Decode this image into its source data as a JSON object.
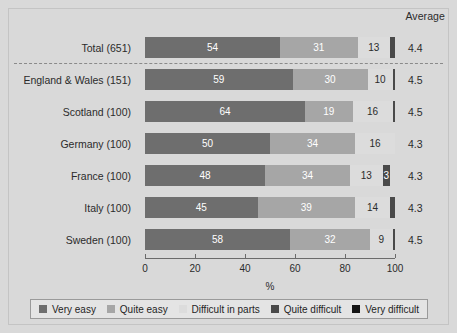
{
  "header": {
    "average_label": "Average"
  },
  "axis": {
    "title": "%",
    "ticks": [
      0,
      20,
      40,
      60,
      80,
      100
    ],
    "min": 0,
    "max": 100
  },
  "legend": {
    "items": [
      {
        "label": "Very easy",
        "color": "#6e6e6e",
        "key": "very_easy"
      },
      {
        "label": "Quite easy",
        "color": "#a6a6a6",
        "key": "quite_easy"
      },
      {
        "label": "Difficult in parts",
        "color": "#dcdcdc",
        "key": "difficult_in_parts"
      },
      {
        "label": "Quite difficult",
        "color": "#4a4a4a",
        "key": "quite_difficult"
      },
      {
        "label": "Very difficult",
        "color": "#141414",
        "key": "very_difficult"
      }
    ]
  },
  "chart_data": {
    "type": "bar",
    "title": "",
    "subtitle": "",
    "orientation": "horizontal",
    "stacked": true,
    "stack_total": 100,
    "xlabel": "%",
    "ylabel": "",
    "xlim": [
      0,
      100
    ],
    "xticks": [
      0,
      20,
      40,
      60,
      80,
      100
    ],
    "grid": false,
    "legend_position": "bottom",
    "categories": [
      "Total (651)",
      "England & Wales (151)",
      "Scotland (100)",
      "Germany (100)",
      "France (100)",
      "Italy (100)",
      "Sweden (100)"
    ],
    "series": [
      {
        "name": "Very easy",
        "color": "#6e6e6e",
        "values": [
          54,
          59,
          64,
          50,
          48,
          45,
          58
        ]
      },
      {
        "name": "Quite easy",
        "color": "#a6a6a6",
        "values": [
          31,
          30,
          19,
          34,
          34,
          39,
          32
        ]
      },
      {
        "name": "Difficult in parts",
        "color": "#dcdcdc",
        "values": [
          13,
          10,
          16,
          16,
          13,
          14,
          9
        ]
      },
      {
        "name": "Quite difficult",
        "color": "#4a4a4a",
        "values": [
          2,
          1,
          1,
          0,
          3,
          2,
          1
        ]
      },
      {
        "name": "Very difficult",
        "color": "#141414",
        "values": [
          0,
          0,
          0,
          0,
          0,
          0,
          0
        ]
      }
    ],
    "annotations": {
      "average_column_label": "Average",
      "averages": [
        4.4,
        4.5,
        4.5,
        4.3,
        4.3,
        4.3,
        4.5
      ],
      "separator_after_row": 0
    }
  },
  "rows": [
    {
      "label": "Total (651)",
      "average": "4.4",
      "segments": [
        {
          "key": "very_easy",
          "value": 54,
          "text": "54"
        },
        {
          "key": "quite_easy",
          "value": 31,
          "text": "31"
        },
        {
          "key": "difficult_in_parts",
          "value": 13,
          "text": "13"
        },
        {
          "key": "quite_difficult",
          "value": 2,
          "text": ""
        }
      ]
    },
    {
      "label": "England & Wales (151)",
      "average": "4.5",
      "segments": [
        {
          "key": "very_easy",
          "value": 59,
          "text": "59"
        },
        {
          "key": "quite_easy",
          "value": 30,
          "text": "30"
        },
        {
          "key": "difficult_in_parts",
          "value": 10,
          "text": "10"
        },
        {
          "key": "quite_difficult",
          "value": 1,
          "text": ""
        }
      ]
    },
    {
      "label": "Scotland (100)",
      "average": "4.5",
      "segments": [
        {
          "key": "very_easy",
          "value": 64,
          "text": "64"
        },
        {
          "key": "quite_easy",
          "value": 19,
          "text": "19"
        },
        {
          "key": "difficult_in_parts",
          "value": 16,
          "text": "16"
        },
        {
          "key": "quite_difficult",
          "value": 1,
          "text": ""
        }
      ]
    },
    {
      "label": "Germany (100)",
      "average": "4.3",
      "segments": [
        {
          "key": "very_easy",
          "value": 50,
          "text": "50"
        },
        {
          "key": "quite_easy",
          "value": 34,
          "text": "34"
        },
        {
          "key": "difficult_in_parts",
          "value": 16,
          "text": "16"
        }
      ]
    },
    {
      "label": "France (100)",
      "average": "4.3",
      "segments": [
        {
          "key": "very_easy",
          "value": 48,
          "text": "48"
        },
        {
          "key": "quite_easy",
          "value": 34,
          "text": "34"
        },
        {
          "key": "difficult_in_parts",
          "value": 13,
          "text": "13"
        },
        {
          "key": "quite_difficult",
          "value": 3,
          "text": "3"
        }
      ]
    },
    {
      "label": "Italy (100)",
      "average": "4.3",
      "segments": [
        {
          "key": "very_easy",
          "value": 45,
          "text": "45"
        },
        {
          "key": "quite_easy",
          "value": 39,
          "text": "39"
        },
        {
          "key": "difficult_in_parts",
          "value": 14,
          "text": "14"
        },
        {
          "key": "quite_difficult",
          "value": 2,
          "text": ""
        }
      ]
    },
    {
      "label": "Sweden (100)",
      "average": "4.5",
      "segments": [
        {
          "key": "very_easy",
          "value": 58,
          "text": "58"
        },
        {
          "key": "quite_easy",
          "value": 32,
          "text": "32"
        },
        {
          "key": "difficult_in_parts",
          "value": 9,
          "text": "9"
        },
        {
          "key": "quite_difficult",
          "value": 1,
          "text": ""
        }
      ]
    }
  ]
}
